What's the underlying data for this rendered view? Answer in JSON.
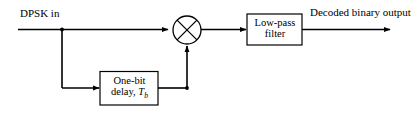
{
  "diagram": {
    "stroke_color": "#000000",
    "background_color": "#ffffff",
    "labels": {
      "input": "DPSK in",
      "output": "Decoded binary output"
    },
    "blocks": [
      {
        "name": "low-pass-filter",
        "line1": "Low-pass",
        "line2": "filter"
      },
      {
        "name": "one-bit-delay",
        "line1": "One-bit",
        "line2_prefix": "delay, ",
        "line2_symbol": "T",
        "line2_subscript": "b"
      }
    ],
    "operators": [
      {
        "name": "multiplier",
        "symbol": "×",
        "shape": "circle-with-x"
      }
    ]
  }
}
